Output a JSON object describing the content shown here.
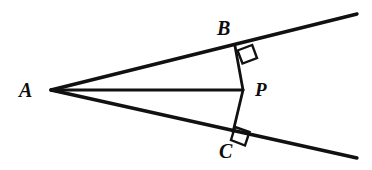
{
  "figure": {
    "name": "angle-with-interior-point-perpendiculars",
    "background_color": "#ffffff",
    "stroke_color": "#111111",
    "canvas": {
      "width": 372,
      "height": 170
    },
    "labels": {
      "a": "A",
      "b": "B",
      "p": "P",
      "c": "C"
    },
    "points": {
      "A": {
        "x": 51,
        "y": 90
      },
      "B": {
        "x": 235,
        "y": 46
      },
      "P": {
        "x": 243,
        "y": 90
      },
      "C": {
        "x": 233,
        "y": 132
      },
      "upper_ray_end": {
        "x": 357,
        "y": 14
      },
      "lower_ray_end": {
        "x": 357,
        "y": 158
      }
    },
    "segments": [
      {
        "name": "ray-AB-upper",
        "from": "A",
        "to": "upper_ray_end",
        "width": 3.4
      },
      {
        "name": "ray-AC-lower",
        "from": "A",
        "to": "lower_ray_end",
        "width": 3.4
      },
      {
        "name": "segment-AP-bisector",
        "from": "A",
        "to": "P",
        "width": 2.6
      },
      {
        "name": "segment-PB",
        "from": "P",
        "to": "B",
        "width": 2.6
      },
      {
        "name": "segment-PC",
        "from": "P",
        "to": "C",
        "width": 2.6
      }
    ],
    "right_angle_marks": [
      {
        "name": "right-angle-at-B",
        "at": "B",
        "points": "237.5,50.5 252.2,45.0 257.0,58.0 242.5,63.5"
      },
      {
        "name": "right-angle-at-C",
        "at": "C",
        "points": "235.0,127.0 249.5,132.0 245.0,145.5 231.0,140.0"
      }
    ]
  }
}
